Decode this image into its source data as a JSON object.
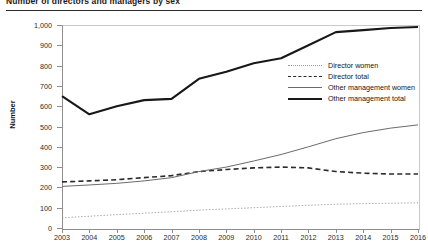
{
  "chart_title": "Number of directors and managers by sex",
  "y_axis_title": "Number",
  "legend": {
    "position": "inside-right-upper",
    "entries": [
      {
        "label": "Director women",
        "style": "dotted",
        "width": 0.8,
        "color": "#8a8a8a"
      },
      {
        "label": "Director total",
        "style": "dashed",
        "width": 1.5,
        "color": "#2b2b2b"
      },
      {
        "label": "Other management women",
        "style": "thin-solid",
        "width": 0.9,
        "color": "#6e6e6e"
      },
      {
        "label": "Other management total",
        "style": "thick-solid",
        "width": 2.1,
        "color": "#1a1a1a"
      }
    ]
  },
  "chart_data": {
    "type": "line",
    "title": "Number of directors and managers by sex",
    "xlabel": "",
    "ylabel": "Number",
    "ylim": [
      0,
      1000
    ],
    "ytick_step": 100,
    "ytick_labels": [
      "0",
      "100",
      "200",
      "300",
      "400",
      "500",
      "600",
      "700",
      "800",
      "900",
      "1,000"
    ],
    "grid": false,
    "categories": [
      2003,
      2004,
      2005,
      2006,
      2007,
      2008,
      2009,
      2010,
      2011,
      2012,
      2013,
      2014,
      2015,
      2016
    ],
    "series": [
      {
        "name": "Director women",
        "style": "dotted",
        "values": [
          50,
          58,
          66,
          73,
          80,
          88,
          94,
          100,
          106,
          112,
          117,
          120,
          122,
          124
        ]
      },
      {
        "name": "Director total",
        "style": "dashed",
        "values": [
          227,
          232,
          238,
          248,
          258,
          278,
          288,
          296,
          300,
          296,
          278,
          270,
          266,
          266
        ]
      },
      {
        "name": "Other management women",
        "style": "thin-solid",
        "values": [
          205,
          212,
          220,
          232,
          248,
          278,
          300,
          330,
          362,
          400,
          440,
          470,
          492,
          508
        ]
      },
      {
        "name": "Other management total",
        "style": "thick-solid",
        "values": [
          650,
          560,
          600,
          630,
          636,
          735,
          770,
          812,
          836,
          900,
          965,
          975,
          985,
          990
        ]
      }
    ]
  }
}
